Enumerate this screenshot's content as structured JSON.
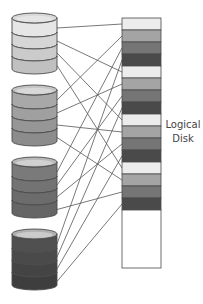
{
  "diagram": {
    "label_line1": "Logical",
    "label_line2": "Disk",
    "physical_disks": [
      {
        "name": "disk-1",
        "top": 13,
        "bands": [
          "#e6e6e6",
          "#d6d6d6",
          "#cbcbcb",
          "#c0c0c0"
        ],
        "cap": "#d8d8d8"
      },
      {
        "name": "disk-2",
        "top": 85,
        "bands": [
          "#a8a8a8",
          "#a0a0a0",
          "#969696",
          "#8c8c8c"
        ],
        "cap": "#c4c4c4"
      },
      {
        "name": "disk-3",
        "top": 157,
        "bands": [
          "#7a7a7a",
          "#737373",
          "#6c6c6c",
          "#656565"
        ],
        "cap": "#b8b8b8"
      },
      {
        "name": "disk-4",
        "top": 229,
        "bands": [
          "#505050",
          "#4a4a4a",
          "#444444",
          "#3e3e3e"
        ],
        "cap": "#b0b0b0"
      }
    ],
    "logical_disk": {
      "x": 122,
      "y": 18,
      "width": 39,
      "height": 250,
      "block_height": 12,
      "block_colors": [
        "#ececec",
        "#a4a4a4",
        "#757575",
        "#4a4a4a"
      ],
      "block_count": 16
    },
    "colors": {
      "line": "#555555",
      "outline": "#4a4a4a",
      "background": "#ffffff"
    }
  }
}
